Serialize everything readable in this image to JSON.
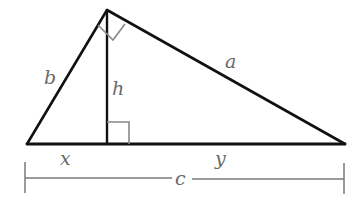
{
  "diagram": {
    "type": "right-triangle-altitude",
    "labels": {
      "hypotenuse_side": "a",
      "left_side": "b",
      "altitude": "h",
      "left_segment": "x",
      "right_segment": "y",
      "base_length": "c"
    },
    "vertices": {
      "left": [
        27,
        144
      ],
      "top": [
        107,
        10
      ],
      "right": [
        345,
        144
      ],
      "altitude_foot": [
        107,
        144
      ]
    },
    "colors": {
      "stroke": "#111111",
      "dimension_line": "#7a7a7a",
      "label": "#6a6a6a",
      "right_angle_mark": "#8a8a8a"
    }
  }
}
